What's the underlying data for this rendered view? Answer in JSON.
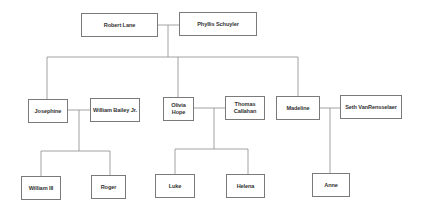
{
  "diagram": {
    "type": "family-tree",
    "colors": {
      "box_border": "#7a7a7a",
      "line": "#8a8a8a",
      "text": "#333333",
      "background": "#ffffff"
    },
    "generations": [
      {
        "level": 1,
        "couples": [
          {
            "partners": [
              "Robert Lane",
              "Phyllis Schuyler"
            ]
          }
        ]
      },
      {
        "level": 2,
        "couples": [
          {
            "partners": [
              "Josephine",
              "William Bailey Jr."
            ]
          },
          {
            "partners": [
              "Olivia Hope",
              "Thomas Callahan"
            ]
          },
          {
            "partners": [
              "Madeline",
              "Seth VanRensselaer"
            ]
          }
        ]
      },
      {
        "level": 3,
        "children_of": {
          "Josephine & William Bailey Jr.": [
            "William III",
            "Roger"
          ],
          "Olivia Hope & Thomas Callahan": [
            "Luke",
            "Helena"
          ],
          "Madeline & Seth VanRensselaer": [
            "Anne"
          ]
        }
      }
    ],
    "nodes": {
      "robert": {
        "label": "Robert Lane"
      },
      "phyllis": {
        "label": "Phyllis Schuyler"
      },
      "josephine": {
        "label": "Josephine"
      },
      "william_jr": {
        "label": "William Bailey Jr."
      },
      "olivia": {
        "label": "Olivia Hope"
      },
      "thomas": {
        "label": "Thomas Callahan"
      },
      "madeline": {
        "label": "Madeline"
      },
      "seth": {
        "label": "Seth VanRensselaer"
      },
      "william_iii": {
        "label": "William III"
      },
      "roger": {
        "label": "Roger"
      },
      "luke": {
        "label": "Luke"
      },
      "helena": {
        "label": "Helena"
      },
      "anne": {
        "label": "Anne"
      }
    }
  }
}
